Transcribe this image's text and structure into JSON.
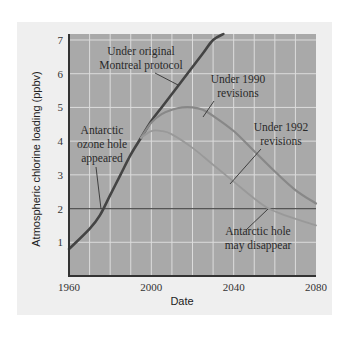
{
  "chart_data": {
    "type": "line",
    "title": "",
    "xlabel": "Date",
    "ylabel": "Atmospheric chlorine loading (ppbv)",
    "xlim": [
      1960,
      2080
    ],
    "ylim": [
      0,
      7
    ],
    "x_ticks": [
      1960,
      2000,
      2040,
      2080
    ],
    "y_ticks": [
      1,
      2,
      3,
      4,
      5,
      6,
      7
    ],
    "grid": true,
    "grid_x_step": 10,
    "grid_y_step": 1,
    "threshold_line": {
      "y": 2,
      "label": "Antarctic hole may disappear"
    },
    "series": [
      {
        "name": "Under original Montreal protocol",
        "color": "#444444",
        "points": [
          [
            1960,
            0.8
          ],
          [
            1970,
            1.4
          ],
          [
            1975,
            1.8
          ],
          [
            1980,
            2.4
          ],
          [
            1985,
            3.0
          ],
          [
            1990,
            3.6
          ],
          [
            1995,
            4.1
          ],
          [
            2000,
            4.6
          ],
          [
            2005,
            5.0
          ],
          [
            2010,
            5.4
          ],
          [
            2015,
            5.8
          ],
          [
            2020,
            6.2
          ],
          [
            2025,
            6.6
          ],
          [
            2030,
            7.0
          ],
          [
            2035,
            7.3
          ]
        ]
      },
      {
        "name": "Under 1990 revisions",
        "color": "#888888",
        "points": [
          [
            1995,
            4.1
          ],
          [
            2000,
            4.55
          ],
          [
            2005,
            4.8
          ],
          [
            2010,
            4.93
          ],
          [
            2015,
            5.0
          ],
          [
            2020,
            5.0
          ],
          [
            2025,
            4.93
          ],
          [
            2030,
            4.75
          ],
          [
            2040,
            4.3
          ],
          [
            2050,
            3.7
          ],
          [
            2060,
            3.1
          ],
          [
            2070,
            2.55
          ],
          [
            2080,
            2.15
          ]
        ]
      },
      {
        "name": "Under 1992 revisions",
        "color": "#999999",
        "points": [
          [
            1995,
            4.1
          ],
          [
            2000,
            4.3
          ],
          [
            2005,
            4.3
          ],
          [
            2010,
            4.2
          ],
          [
            2020,
            3.8
          ],
          [
            2030,
            3.3
          ],
          [
            2040,
            2.8
          ],
          [
            2050,
            2.3
          ],
          [
            2057,
            2.0
          ],
          [
            2065,
            1.8
          ],
          [
            2080,
            1.5
          ]
        ]
      }
    ],
    "annotations": [
      {
        "text": [
          "Under original",
          "Montreal protocol"
        ],
        "target": [
          2016,
          5.9
        ]
      },
      {
        "text": [
          "Under 1990",
          "revisions"
        ],
        "target": [
          2020,
          5.0
        ]
      },
      {
        "text": [
          "Under 1992",
          "revisions"
        ],
        "target": [
          2040,
          2.9
        ]
      },
      {
        "text": [
          "Antarctic",
          "ozone hole",
          "appeared"
        ],
        "target": [
          1976,
          2.0
        ]
      },
      {
        "text": [
          "Antarctic hole",
          "may disappear"
        ],
        "target": [
          2057,
          2.0
        ]
      }
    ]
  },
  "labels": {
    "ylabel": "Atmospheric chlorine loading (ppbv)",
    "xlabel": "Date",
    "x_ticks": [
      "1960",
      "2000",
      "2040",
      "2080"
    ],
    "y_ticks": [
      "1",
      "2",
      "3",
      "4",
      "5",
      "6",
      "7"
    ],
    "ann_original_1": "Under original",
    "ann_original_2": "Montreal protocol",
    "ann_1990_1": "Under 1990",
    "ann_1990_2": "revisions",
    "ann_1992_1": "Under 1992",
    "ann_1992_2": "revisions",
    "ann_appeared_1": "Antarctic",
    "ann_appeared_2": "ozone hole",
    "ann_appeared_3": "appeared",
    "ann_disappear_1": "Antarctic hole",
    "ann_disappear_2": "may disappear"
  },
  "colors": {
    "plot_bg": "#a9a9a9",
    "panel_bg": "#efefef",
    "grid": "#dcdcdc",
    "axis": "#333333"
  }
}
